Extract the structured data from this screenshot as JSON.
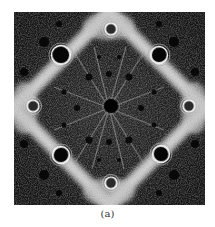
{
  "figure": {
    "caption": "(a)",
    "colors": {
      "background": "#141414",
      "band": "#d9d9d9",
      "ring": "#f0f0f0",
      "hole": "#050505"
    }
  }
}
